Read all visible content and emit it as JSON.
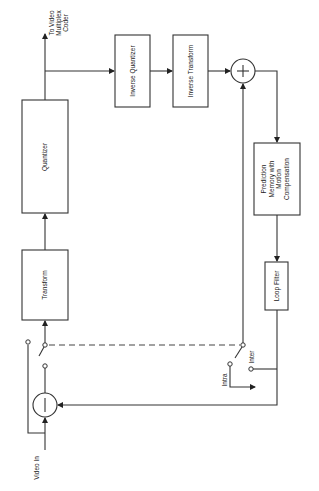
{
  "diagram": {
    "orientation": "rotated-90-ccw",
    "blocks": {
      "transform": {
        "label": "Transform"
      },
      "quantizer": {
        "label": "Quantizer"
      },
      "inverse_quantizer": {
        "label": "Inverse Quantizer"
      },
      "inverse_transform": {
        "label": "Inverse Transform"
      },
      "prediction_memory": {
        "lines": [
          "Prediction",
          "Memory with",
          "Motion",
          "Compensation"
        ]
      },
      "loop_filter": {
        "label": "Loop Filter"
      }
    },
    "nodes": {
      "subtractor": {
        "symbol": "−"
      },
      "adder": {
        "symbol": "+"
      }
    },
    "labels": {
      "input": "Video In",
      "output_lines": [
        "To Video",
        "Multiplex",
        "Coder"
      ],
      "switch_intra": "Intra",
      "switch_inter": "Inter"
    }
  }
}
